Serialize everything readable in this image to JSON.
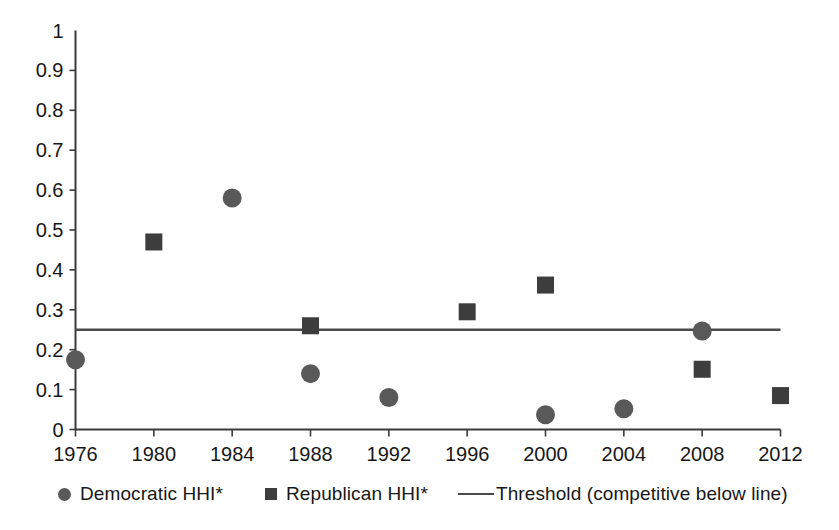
{
  "chart_data": {
    "type": "scatter",
    "title": "",
    "xlabel": "",
    "ylabel": "",
    "x": [
      1976,
      1980,
      1984,
      1988,
      1992,
      1996,
      2000,
      2004,
      2008,
      2012
    ],
    "categories": [
      "1976",
      "1980",
      "1984",
      "1988",
      "1992",
      "1996",
      "2000",
      "2004",
      "2008",
      "2012"
    ],
    "xlim": [
      1976,
      2012
    ],
    "ylim": [
      0,
      1
    ],
    "ytick_labels": [
      "0",
      "0.1",
      "0.2",
      "0.3",
      "0.4",
      "0.5",
      "0.6",
      "0.7",
      "0.8",
      "0.9",
      "1"
    ],
    "ytick_values": [
      0,
      0.1,
      0.2,
      0.3,
      0.4,
      0.5,
      0.6,
      0.7,
      0.8,
      0.9,
      1
    ],
    "grid": false,
    "legend_position": "bottom",
    "series": [
      {
        "name": "Democratic HHI*",
        "marker": "circle",
        "color": "#595959",
        "points": [
          {
            "x": 1976,
            "y": 0.175
          },
          {
            "x": 1984,
            "y": 0.58
          },
          {
            "x": 1988,
            "y": 0.14
          },
          {
            "x": 1992,
            "y": 0.08
          },
          {
            "x": 2000,
            "y": 0.037
          },
          {
            "x": 2004,
            "y": 0.052
          },
          {
            "x": 2008,
            "y": 0.247
          }
        ]
      },
      {
        "name": "Republican HHI*",
        "marker": "square",
        "color": "#3d3d3d",
        "points": [
          {
            "x": 1980,
            "y": 0.47
          },
          {
            "x": 1988,
            "y": 0.26
          },
          {
            "x": 1996,
            "y": 0.295
          },
          {
            "x": 2000,
            "y": 0.362
          },
          {
            "x": 2008,
            "y": 0.151
          },
          {
            "x": 2012,
            "y": 0.085
          }
        ]
      }
    ],
    "threshold": {
      "name": "Threshold (competitive below line)",
      "value": 0.25,
      "color": "#4a4a4a"
    }
  },
  "legend": {
    "items": [
      {
        "label": "Democratic HHI*",
        "marker": "circle"
      },
      {
        "label": "Republican HHI*",
        "marker": "square"
      },
      {
        "label": "Threshold (competitive below line)",
        "marker": "line"
      }
    ]
  },
  "colors": {
    "democratic": "#595959",
    "republican": "#3d3d3d",
    "threshold": "#4a4a4a",
    "axis": "#3a3a3a",
    "text": "#171717",
    "background": "#ffffff"
  }
}
